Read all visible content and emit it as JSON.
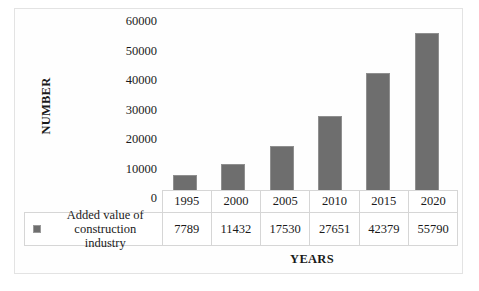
{
  "chart_data": {
    "type": "bar",
    "title": "",
    "xlabel": "YEARS",
    "ylabel": "NUMBER",
    "categories": [
      "1995",
      "2000",
      "2005",
      "2010",
      "2015",
      "2020"
    ],
    "values": [
      7789,
      11432,
      17530,
      27651,
      42379,
      55790
    ],
    "series": [
      {
        "name": "Added value of construction industry",
        "values": [
          7789,
          11432,
          17530,
          27651,
          42379,
          55790
        ]
      }
    ],
    "ylim": [
      0,
      60000
    ],
    "yticks": [
      "0",
      "10000",
      "20000",
      "30000",
      "40000",
      "50000",
      "60000"
    ],
    "grid": false,
    "legend_position": "bottom-left-table",
    "bar_color": "#6e6e6e",
    "bar_border_color": "#8f8f8f"
  },
  "axes": {
    "y_title": "NUMBER",
    "x_title": "YEARS",
    "tick_labels": [
      "60000",
      "50000",
      "40000",
      "30000",
      "20000",
      "10000",
      "0"
    ]
  },
  "table": {
    "legend_label_line1": "Added value of",
    "legend_label_line2": "construction industry",
    "years": [
      "1995",
      "2000",
      "2005",
      "2010",
      "2015",
      "2020"
    ],
    "values": [
      "7789",
      "11432",
      "17530",
      "27651",
      "42379",
      "55790"
    ]
  },
  "colors": {
    "bar": "#6e6e6e",
    "bar_border": "#8f8f8f",
    "grid_line": "#d6d6d6",
    "frame": "#e3e3e3",
    "text": "#1a1a1a"
  }
}
